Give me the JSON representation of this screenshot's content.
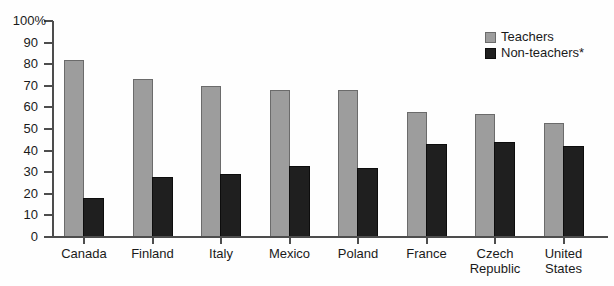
{
  "chart_data": {
    "type": "bar",
    "title": "",
    "categories": [
      "Canada",
      "Finland",
      "Italy",
      "Mexico",
      "Poland",
      "France",
      "Czech Republic",
      "United States"
    ],
    "category_label_lines": [
      [
        "Canada"
      ],
      [
        "Finland"
      ],
      [
        "Italy"
      ],
      [
        "Mexico"
      ],
      [
        "Poland"
      ],
      [
        "France"
      ],
      [
        "Czech",
        "Republic"
      ],
      [
        "United",
        "States"
      ]
    ],
    "series": [
      {
        "name": "Teachers",
        "values": [
          82,
          73,
          70,
          68,
          68,
          58,
          57,
          53
        ],
        "fill": "#9d9d9d",
        "stroke": "#6b6b6b"
      },
      {
        "name": "Non-teachers*",
        "values": [
          18,
          28,
          29,
          33,
          32,
          43,
          44,
          42
        ],
        "fill": "#1f1f1f",
        "stroke": "#0d0d0d"
      }
    ],
    "xlabel": "",
    "ylabel": "",
    "ylim": [
      0,
      100
    ],
    "y_tick_labels": [
      "100%",
      "90",
      "80",
      "70",
      "60",
      "50",
      "40",
      "30",
      "20",
      "10",
      "0"
    ],
    "grid": false,
    "legend_position": "top-right",
    "axis_color": "#4d4d4d",
    "text_color": "#1a1a1a"
  }
}
